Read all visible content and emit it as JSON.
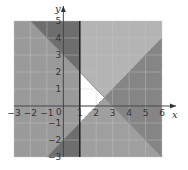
{
  "chart_data": {
    "type": "region",
    "title": "",
    "xlabel": "x",
    "ylabel": "y",
    "xlim": [
      -3,
      6
    ],
    "ylim": [
      -3,
      5
    ],
    "grid": true,
    "x_ticks": [
      "-3",
      "-2",
      "-1",
      "1",
      "2",
      "3",
      "4",
      "5",
      "6"
    ],
    "y_ticks": [
      "5",
      "4",
      "3",
      "2",
      "1",
      "-1",
      "-2",
      "-3"
    ],
    "origin_label": "0",
    "boundaries": [
      {
        "equation": "y = -x + 3",
        "style": "solid",
        "points": [
          [
            -2,
            5
          ],
          [
            6,
            -3
          ]
        ]
      },
      {
        "equation": "y = x - 2",
        "style": "dashed",
        "points": [
          [
            -1,
            -3
          ],
          [
            6,
            4
          ]
        ]
      },
      {
        "equation": "x = 1",
        "style": "solid",
        "points": [
          [
            1,
            -3
          ],
          [
            1,
            5
          ]
        ]
      }
    ],
    "solution_region": {
      "description": "unshaded (white) region satisfying x > 1, y < -x + 3, y > x - 2",
      "vertices": [
        [
          1,
          2
        ],
        [
          2.5,
          0.5
        ],
        [
          1,
          -1
        ]
      ]
    },
    "colors": {
      "background_shade": "#9a9a9a",
      "light_shade": "#b4b4b4",
      "dark_shade": "#6e6e6e",
      "mid_dark_shade": "#858585",
      "solution": "#ffffff",
      "grid": "#c8c8c8",
      "axis": "#333333"
    }
  }
}
